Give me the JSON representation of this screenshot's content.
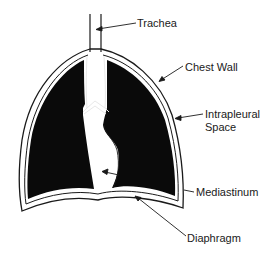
{
  "diagram": {
    "type": "anatomical-schematic",
    "colors": {
      "background": "#ffffff",
      "lung_fill": "#0a0a0a",
      "outline": "#1a1a1a",
      "text": "#1a1a1a"
    },
    "labels": {
      "trachea": "Trachea",
      "chest_wall": "Chest Wall",
      "intrapleural_line1": "Intrapleural",
      "intrapleural_line2": "Space",
      "mediastinum": "Mediastinum",
      "diaphragm": "Diaphragm"
    }
  }
}
